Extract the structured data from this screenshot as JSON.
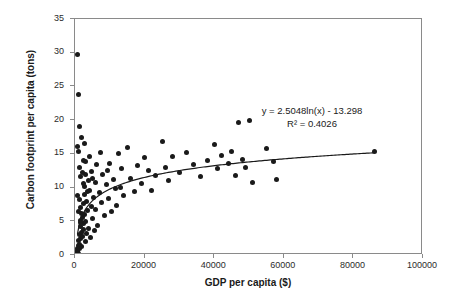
{
  "chart_data": {
    "type": "scatter",
    "title": "",
    "xlabel": "GDP per capita ($)",
    "ylabel": "Carbon footprint per capita (tons)",
    "xlim": [
      0,
      100000
    ],
    "ylim": [
      0,
      35
    ],
    "xticks": [
      "0",
      "20000",
      "40000",
      "60000",
      "80000",
      "100000"
    ],
    "yticks": [
      "0",
      "5",
      "10",
      "15",
      "20",
      "25",
      "30",
      "35"
    ],
    "grid": false,
    "legend": false,
    "annotations": {
      "equation": "y = 2.5048ln(x) - 13.298",
      "r_squared": "R² = 0.4026"
    },
    "trendline": {
      "type": "logarithmic",
      "a": 2.5048,
      "b": -13.298,
      "x_start": 700,
      "x_end": 86000
    },
    "marker_color": "#1a1a1a",
    "points": [
      [
        500,
        0.4
      ],
      [
        600,
        0.7
      ],
      [
        700,
        1.0
      ],
      [
        800,
        0.5
      ],
      [
        900,
        1.4
      ],
      [
        1000,
        0.2
      ],
      [
        1100,
        2.1
      ],
      [
        1200,
        0.9
      ],
      [
        1300,
        3.0
      ],
      [
        1400,
        1.6
      ],
      [
        1500,
        4.2
      ],
      [
        1600,
        2.4
      ],
      [
        1700,
        5.1
      ],
      [
        1800,
        3.4
      ],
      [
        1900,
        6.2
      ],
      [
        600,
        29.8
      ],
      [
        700,
        16.1
      ],
      [
        900,
        15.4
      ],
      [
        1200,
        8.2
      ],
      [
        1500,
        7.0
      ],
      [
        2000,
        1.2
      ],
      [
        2100,
        2.8
      ],
      [
        2200,
        5.6
      ],
      [
        2300,
        3.8
      ],
      [
        2400,
        7.6
      ],
      [
        2500,
        4.6
      ],
      [
        2600,
        9.0
      ],
      [
        2700,
        6.0
      ],
      [
        2800,
        10.2
      ],
      [
        2900,
        2.0
      ],
      [
        3000,
        5.0
      ],
      [
        3200,
        8.0
      ],
      [
        3400,
        3.2
      ],
      [
        3600,
        6.6
      ],
      [
        3800,
        11.0
      ],
      [
        4000,
        4.0
      ],
      [
        4200,
        9.6
      ],
      [
        4400,
        2.6
      ],
      [
        4600,
        7.2
      ],
      [
        4800,
        12.4
      ],
      [
        5000,
        5.4
      ],
      [
        5200,
        8.6
      ],
      [
        5500,
        3.6
      ],
      [
        5800,
        10.8
      ],
      [
        6000,
        6.8
      ],
      [
        1000,
        23.8
      ],
      [
        1300,
        13.0
      ],
      [
        1700,
        11.6
      ],
      [
        2100,
        12.2
      ],
      [
        2500,
        14.0
      ],
      [
        6500,
        4.4
      ],
      [
        7000,
        9.2
      ],
      [
        7500,
        7.8
      ],
      [
        8000,
        12.0
      ],
      [
        8500,
        5.8
      ],
      [
        9000,
        10.4
      ],
      [
        9500,
        8.4
      ],
      [
        10000,
        13.6
      ],
      [
        10500,
        6.4
      ],
      [
        11000,
        11.2
      ],
      [
        11500,
        9.8
      ],
      [
        12000,
        7.4
      ],
      [
        12500,
        15.0
      ],
      [
        13000,
        10.0
      ],
      [
        13500,
        12.8
      ],
      [
        14000,
        8.8
      ],
      [
        15000,
        16.0
      ],
      [
        16000,
        11.4
      ],
      [
        17000,
        9.4
      ],
      [
        18000,
        13.2
      ],
      [
        19000,
        10.6
      ],
      [
        20000,
        14.4
      ],
      [
        21000,
        12.6
      ],
      [
        22000,
        9.6
      ],
      [
        23000,
        11.8
      ],
      [
        1400,
        19.0
      ],
      [
        1800,
        17.4
      ],
      [
        2300,
        10.6
      ],
      [
        2900,
        13.8
      ],
      [
        3500,
        9.4
      ],
      [
        25000,
        16.8
      ],
      [
        26000,
        13.0
      ],
      [
        27000,
        11.0
      ],
      [
        28000,
        14.6
      ],
      [
        30000,
        12.2
      ],
      [
        32000,
        15.2
      ],
      [
        34000,
        13.4
      ],
      [
        36000,
        11.6
      ],
      [
        38000,
        14.0
      ],
      [
        40000,
        16.4
      ],
      [
        41000,
        12.8
      ],
      [
        42000,
        14.8
      ],
      [
        44000,
        13.6
      ],
      [
        45000,
        15.4
      ],
      [
        46000,
        11.8
      ],
      [
        47000,
        19.6
      ],
      [
        48000,
        14.2
      ],
      [
        49000,
        13.0
      ],
      [
        50000,
        20.0
      ],
      [
        51000,
        10.8
      ],
      [
        55000,
        15.8
      ],
      [
        57000,
        13.8
      ],
      [
        58000,
        11.2
      ],
      [
        86000,
        15.4
      ],
      [
        800,
        8.8
      ],
      [
        1100,
        6.4
      ],
      [
        1600,
        4.8
      ],
      [
        2700,
        16.6
      ],
      [
        3100,
        12.0
      ],
      [
        4100,
        14.6
      ],
      [
        5100,
        11.4
      ],
      [
        6200,
        13.4
      ],
      [
        7200,
        15.2
      ],
      [
        9200,
        12.6
      ]
    ]
  }
}
